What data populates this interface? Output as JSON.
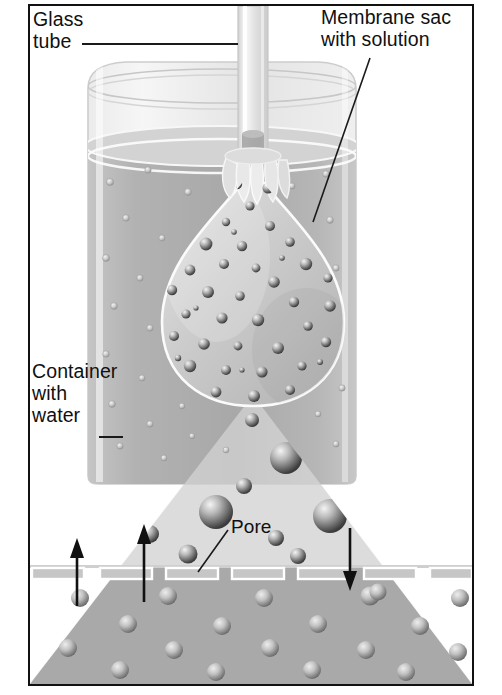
{
  "figure": {
    "border_color": "#111111",
    "background": "#ffffff"
  },
  "labels": {
    "glass_tube": "Glass\ntube",
    "membrane_sac": "Membrane sac\nwith solution",
    "container_water": "Container\nwith\nwater",
    "pore": "Pore"
  },
  "leaders": {
    "glass_tube": {
      "x1": 82,
      "y1": 44,
      "x2": 238,
      "y2": 44,
      "style": "horizontal-rule"
    },
    "membrane_sac": {
      "x1": 370,
      "y1": 58,
      "x2": 313,
      "y2": 222,
      "style": "diagonal"
    },
    "container_water": {
      "x1": 99,
      "y1": 437,
      "x2": 123,
      "y2": 437,
      "style": "short-dash"
    },
    "pore": {
      "x1": 228,
      "y1": 530,
      "x2": 198,
      "y2": 572,
      "style": "diagonal"
    }
  },
  "scene": {
    "beaker": {
      "name": "glass container with water",
      "left": 88,
      "top": 62,
      "right": 418,
      "bottom": 483,
      "rim_y": 86,
      "water_surface_y": 146,
      "glass_tint": "#e8e8e8",
      "water_tint": "#b0b0b0"
    },
    "glass_tube": {
      "name": "glass tube",
      "x_left": 238,
      "x_right": 268,
      "top": 6,
      "bottom": 170,
      "tint": "#e2e2e2"
    },
    "membrane_sac": {
      "name": "membrane sac with solution",
      "center_x": 253,
      "top_y": 168,
      "bottom_y": 400,
      "width": 186,
      "shape": "teardrop",
      "neck": "gathered and tied around tube",
      "fill": "#cfcfcf",
      "outline": "#f4f4f4"
    },
    "magnifier_cone": {
      "name": "magnification wedge",
      "apex_x": 253,
      "apex_y": 395,
      "base_left_x": 30,
      "base_right_x": 472,
      "base_y": 684,
      "tint": "#d8d8d8"
    },
    "membrane_band": {
      "name": "magnified membrane with pores",
      "y": 566,
      "height": 12,
      "pore_count": 7,
      "pore_width": 52,
      "pore_height": 11,
      "pore_x_positions": [
        30,
        98,
        164,
        230,
        296,
        362,
        428
      ],
      "pore_outline": "#ffffff"
    },
    "regions": {
      "above_membrane": {
        "name": "container water (magnified)",
        "tint": "#d9d9d9"
      },
      "below_membrane": {
        "name": "sac solution (magnified)",
        "tint": "#a9a9a9"
      }
    },
    "particles": {
      "water_dots_in_beaker": "small light dots",
      "solute_spheres_in_sac": "medium shaded spheres",
      "magnified_water_spheres": "large shaded spheres",
      "sphere_shading": "radial highlight upper-left, dark lower-right"
    },
    "flow_arrows": [
      {
        "name": "water-in-arrow-left",
        "direction": "up",
        "x": 75,
        "y_from": 604,
        "y_to": 540
      },
      {
        "name": "water-in-arrow-mid",
        "direction": "up",
        "x": 142,
        "y_from": 600,
        "y_to": 526
      },
      {
        "name": "water-out-arrow-right",
        "direction": "down",
        "x": 348,
        "y_from": 524,
        "y_to": 588
      }
    ]
  },
  "colors": {
    "ink": "#101010",
    "paper": "#ffffff",
    "water_gray": "#b4b4b4",
    "solution_gray": "#a9a9a9",
    "glass_gray": "#e6e6e6",
    "sphere_dark": "#4a4a4a",
    "sphere_light": "#f0f0f0"
  }
}
